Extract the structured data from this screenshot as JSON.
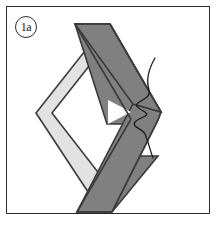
{
  "figure": {
    "step_label": "1a",
    "caption": "",
    "frame_color": "#2b2b2b",
    "background_color": "#ffffff"
  },
  "diagram": {
    "type": "craft-folding-step",
    "elements": [
      {
        "name": "dark-ribbon",
        "label": "Dark folded strip",
        "fill": "#808080",
        "stroke": "#2b2b2b",
        "shape": "chevron pointing right with long tails extending to upper-left and lower-left",
        "points": "74,24 109,24 160,113 150,124 131,124 153,156 156,156 110,212 74,212 124,124 109,124 74,77"
      },
      {
        "name": "light-ribbon",
        "label": "Light folded strip",
        "fill": "#e2e2e2",
        "stroke": "#2b2b2b",
        "shape": "chevron pointing left nested inside the dark strip",
        "points": "88,42 103,42 46,113 103,186 88,197 33,113"
      },
      {
        "name": "thread",
        "label": "Sewing thread",
        "stroke": "#1c1c1c",
        "fill": "none",
        "shape": "wavy thread entering at top right, zigzagging through the right vertex and trailing below"
      }
    ]
  }
}
